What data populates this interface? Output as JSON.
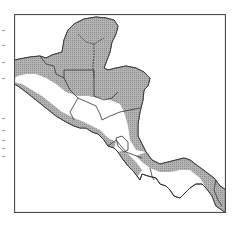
{
  "figure": {
    "type": "distribution-map",
    "region": "Central America",
    "legend": [],
    "colors": {
      "frame": "#4a4a4a",
      "land_outline": "#333333",
      "range_fill": "#a8a8a8",
      "background": "#ffffff"
    },
    "edge_text_fragments": [
      30,
      45,
      62,
      78,
      118,
      130,
      140,
      148,
      156
    ]
  }
}
